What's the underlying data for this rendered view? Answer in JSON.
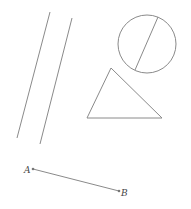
{
  "diagram": {
    "stroke_color": "#8a8a8a",
    "parallel_lines": [
      {
        "x1": 50,
        "y1": 12,
        "x2": 17,
        "y2": 138
      },
      {
        "x1": 72,
        "y1": 18,
        "x2": 40,
        "y2": 144
      }
    ],
    "circle": {
      "cx": 147,
      "cy": 44,
      "r": 29,
      "chord": {
        "x1": 158,
        "y1": 17,
        "x2": 135,
        "y2": 70
      }
    },
    "triangle": {
      "points": "111,68 87,118 162,118"
    },
    "segment": {
      "x1": 33,
      "y1": 169,
      "x2": 119,
      "y2": 191,
      "start_label": "A",
      "end_label": "B"
    }
  }
}
